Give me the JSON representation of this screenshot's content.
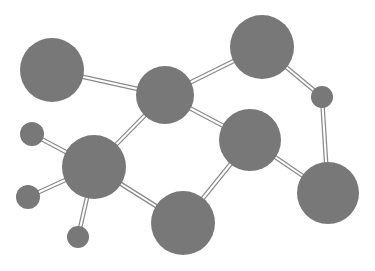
{
  "diagram": {
    "type": "molecular-network",
    "width": 375,
    "height": 271,
    "background": "#ffffff",
    "node_color": "#787878",
    "bond_color": "#8a8a8a",
    "nodes": [
      {
        "id": "A",
        "x": 52,
        "y": 70,
        "r": 32
      },
      {
        "id": "B",
        "x": 165,
        "y": 95,
        "r": 29
      },
      {
        "id": "C",
        "x": 262,
        "y": 47,
        "r": 32
      },
      {
        "id": "D",
        "x": 322,
        "y": 97,
        "r": 11
      },
      {
        "id": "E",
        "x": 250,
        "y": 140,
        "r": 31
      },
      {
        "id": "F",
        "x": 328,
        "y": 193,
        "r": 31
      },
      {
        "id": "G",
        "x": 94,
        "y": 167,
        "r": 32
      },
      {
        "id": "H",
        "x": 183,
        "y": 223,
        "r": 32
      },
      {
        "id": "I",
        "x": 32,
        "y": 134,
        "r": 12
      },
      {
        "id": "J",
        "x": 28,
        "y": 197,
        "r": 12
      },
      {
        "id": "K",
        "x": 78,
        "y": 237,
        "r": 11
      }
    ],
    "bonds": [
      [
        "A",
        "B"
      ],
      [
        "B",
        "C"
      ],
      [
        "C",
        "D"
      ],
      [
        "D",
        "F"
      ],
      [
        "E",
        "F"
      ],
      [
        "B",
        "E"
      ],
      [
        "B",
        "G"
      ],
      [
        "E",
        "H"
      ],
      [
        "G",
        "H"
      ],
      [
        "G",
        "I"
      ],
      [
        "G",
        "J"
      ],
      [
        "G",
        "K"
      ]
    ]
  }
}
